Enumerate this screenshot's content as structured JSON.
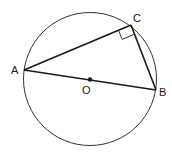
{
  "diagram": {
    "type": "circle-inscribed-right-triangle",
    "circle": {
      "center_label": "O"
    },
    "points": {
      "A": {
        "label": "A"
      },
      "B": {
        "label": "B"
      },
      "C": {
        "label": "C"
      },
      "O": {
        "label": "O"
      }
    },
    "right_angle_at": "C",
    "segments": [
      "AC",
      "CB",
      "AB"
    ],
    "colors": {
      "stroke": "#1a1a1a",
      "circle": "#333333",
      "background": "#ffffff"
    }
  }
}
